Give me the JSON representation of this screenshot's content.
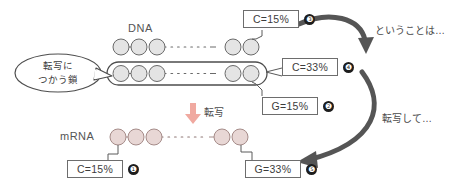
{
  "diagram": {
    "title_dna": "DNA",
    "title_mrna": "mRNA",
    "bubble": {
      "line1": "転写に",
      "line2": "つかう鎖"
    },
    "transcription_label": "転写",
    "notes": {
      "top_right": "ということは…",
      "bottom_right": "転写して…"
    },
    "badges": [
      {
        "id": "badge-1",
        "text": "C=15%",
        "number": "❶",
        "strand": "mRNA",
        "base": "C",
        "value": 15
      },
      {
        "id": "badge-2",
        "text": "G=15%",
        "number": "❷",
        "strand": "DNA-template",
        "base": "G",
        "value": 15
      },
      {
        "id": "badge-3",
        "text": "C=15%",
        "number": "❸",
        "strand": "DNA-coding",
        "base": "C",
        "value": 15
      },
      {
        "id": "badge-4",
        "text": "C=33%",
        "number": "❹",
        "strand": "DNA-template",
        "base": "C",
        "value": 33
      },
      {
        "id": "badge-5",
        "text": "G=33%",
        "number": "❺",
        "strand": "mRNA",
        "base": "G",
        "value": 33
      }
    ],
    "strands": {
      "dna_top": {
        "name": "DNA-coding-strand",
        "left_beads": 3,
        "right_beads": 2,
        "fill": "#e4e4e4",
        "stroke": "#6a6a6a"
      },
      "dna_bottom": {
        "name": "DNA-template-strand",
        "left_beads": 3,
        "right_beads": 2,
        "fill": "#e4e4e4",
        "stroke": "#6a6a6a",
        "boxed": true
      },
      "mrna": {
        "name": "mRNA-strand",
        "left_beads": 3,
        "right_beads": 2,
        "fill": "#e8d7d5",
        "stroke": "#a58b88"
      }
    },
    "colors": {
      "ink": "#4a4a4a",
      "bead_dna": "#e4e4e4",
      "bead_mrna": "#e8d7d5",
      "arrow_gray": "#5a5a5a",
      "arrow_pink": "#f0a9a0",
      "badge_border": "#6d6d6d"
    }
  }
}
